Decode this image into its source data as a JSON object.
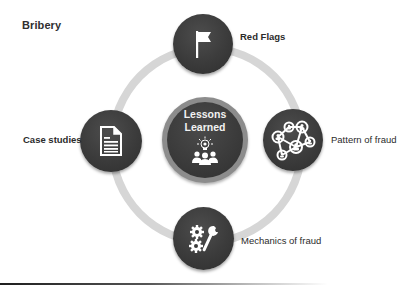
{
  "title": "Bribery",
  "center": {
    "line1": "Lessons",
    "line2": "Learned",
    "icon": "lightbulb-team-icon"
  },
  "nodes": [
    {
      "position": "top",
      "label": "Red Flags",
      "icon": "flag-icon"
    },
    {
      "position": "left",
      "label": "Case studies",
      "icon": "document-icon"
    },
    {
      "position": "right",
      "label": "Pattern of fraud",
      "icon": "network-people-icon"
    },
    {
      "position": "bottom",
      "label": "Mechanics of fraud",
      "icon": "gears-wrench-icon"
    }
  ],
  "colors": {
    "node_fill": "#3b3b3b",
    "center_border": "#8c8c8c",
    "ring": "#d6d6d6",
    "icon": "#ffffff",
    "text": "#2b2b2b"
  }
}
